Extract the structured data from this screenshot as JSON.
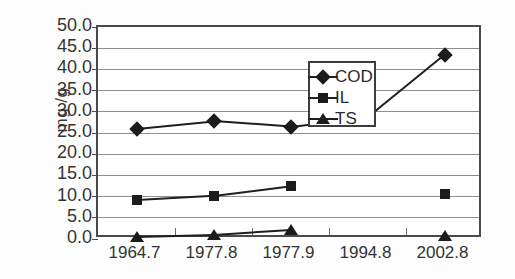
{
  "chart_data": {
    "type": "line",
    "title": "",
    "xlabel": "",
    "ylabel": "mg /g",
    "categories": [
      "1964.7",
      "1977.8",
      "1977.9",
      "1994.8",
      "2002.8"
    ],
    "ylim": [
      0.0,
      50.0
    ],
    "ytick_step": 5.0,
    "ytick_labels": [
      "50.0",
      "45.0",
      "40.0",
      "35.0",
      "30.0",
      "25.0",
      "20.0",
      "15.0",
      "10.0",
      "5.0",
      "0.0"
    ],
    "ytick_values": [
      50.0,
      45.0,
      40.0,
      35.0,
      30.0,
      25.0,
      20.0,
      15.0,
      10.0,
      5.0,
      0.0
    ],
    "grid": "horizontal",
    "legend_position": "upper-center-inside",
    "series": [
      {
        "name": "COD",
        "marker": "diamond",
        "values": [
          26.0,
          27.8,
          26.5,
          28.7,
          43.5
        ],
        "connected": [
          true,
          true,
          true,
          true,
          true
        ]
      },
      {
        "name": "IL",
        "marker": "square",
        "values": [
          9.2,
          10.2,
          12.5,
          null,
          10.7
        ],
        "connected": [
          true,
          true,
          true,
          false,
          false
        ]
      },
      {
        "name": "TS",
        "marker": "triangle",
        "values": [
          0.5,
          1.0,
          2.2,
          null,
          0.8
        ],
        "connected": [
          true,
          true,
          true,
          false,
          false
        ]
      }
    ]
  },
  "legend": {
    "entries": [
      {
        "label": "COD",
        "marker": "diamond"
      },
      {
        "label": "IL",
        "marker": "square"
      },
      {
        "label": "TS",
        "marker": "triangle"
      }
    ]
  },
  "colors": {
    "background": "#ffffff",
    "axis": "#4a4a4a",
    "grid": "#8f8f8f",
    "series": "#1c1c1c",
    "text": "#343434"
  }
}
